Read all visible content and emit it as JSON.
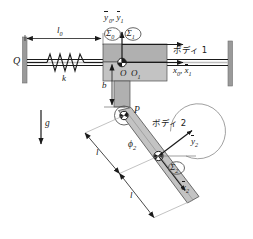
{
  "figure": {
    "type": "mechanical-system-schematic",
    "background_color": "#ffffff",
    "body_fill": "#b3b3b3",
    "body_fill_light": "#c9c9c9",
    "wall_fill": "#999999",
    "line_color": "#1a1a1a",
    "thin_line_color": "#555555"
  },
  "labels": {
    "force_Q": "Q",
    "spring_k": "k",
    "length_l0": "l",
    "length_l0_sub": "0",
    "gravity_g": "g",
    "offset_b": "b",
    "point_P": "P",
    "origin_O": "O",
    "origin_O1": "O",
    "origin_O1_sub": "1",
    "body1": "ボディ 1",
    "body2": "ボディ 2",
    "angle_phi2": "ϕ",
    "angle_phi2_sub": "2",
    "link_length_1": "l",
    "link_length_2": "l"
  },
  "frames": [
    {
      "name": "sigma-0",
      "symbol": "Σ",
      "sub": "0"
    },
    {
      "name": "sigma-1",
      "symbol": "Σ",
      "sub": "1"
    },
    {
      "name": "sigma-2",
      "symbol": "Σ",
      "sub": "2"
    }
  ],
  "axes": {
    "y_top": {
      "y0": "y",
      "y0_sub": "0",
      "y1": "y",
      "y1_sub": "1",
      "text": "y₀, ȳ₁"
    },
    "x_right": {
      "x0": "x",
      "x0_sub": "0",
      "x1": "x",
      "x1_sub": "1",
      "text": "x₀, x̄₁"
    },
    "y2": {
      "sym": "y",
      "sub": "2"
    },
    "x2": {
      "sym": "x",
      "sub": "2"
    }
  }
}
